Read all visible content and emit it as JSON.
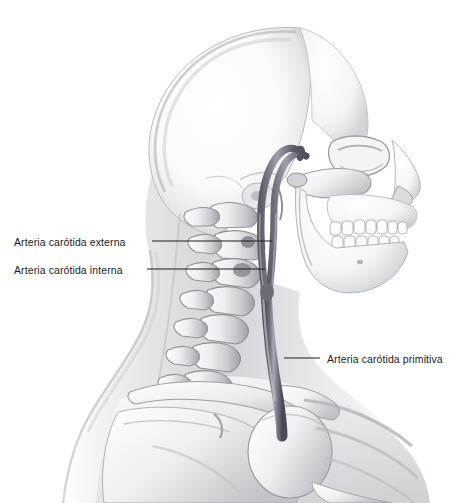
{
  "figure": {
    "kind": "anatomical-illustration",
    "language": "Spanish",
    "background_color": "#ffffff"
  },
  "colors": {
    "background": "#ffffff",
    "bone_light": "#fbfbfc",
    "bone_mid": "#d8dadd",
    "bone_shadow": "#9a9da3",
    "bone_outline": "#6f7378",
    "soft_tissue_light": "#f2f3f4",
    "soft_tissue_mid": "#d5d7da",
    "soft_tissue_dark": "#a8abb0",
    "artery_fill": "#7b7a88",
    "artery_dark": "#4c4b58",
    "artery_highlight": "#b9b8c3",
    "leader_line": "#1c1c1c",
    "label_text": "#1c1c1c"
  },
  "labels": [
    {
      "id": "external",
      "text": "Arteria carótida externa",
      "x": 14,
      "y": 236,
      "leader": {
        "x1": 152,
        "y1": 241,
        "x2": 272,
        "y2": 241
      }
    },
    {
      "id": "internal",
      "text": "Arteria carótida interna",
      "x": 14,
      "y": 264,
      "leader": {
        "x1": 147,
        "y1": 269,
        "x2": 265,
        "y2": 269
      }
    },
    {
      "id": "common",
      "text": "Arteria carótida primitiva",
      "x": 327,
      "y": 353,
      "leader": {
        "x1": 284,
        "y1": 358,
        "x2": 320,
        "y2": 358
      }
    }
  ],
  "structures": [
    {
      "name": "cranium",
      "region": "skull vault"
    },
    {
      "name": "frontal-bone",
      "region": "forehead"
    },
    {
      "name": "orbit",
      "region": "eye socket"
    },
    {
      "name": "nasal-bone",
      "region": "nose"
    },
    {
      "name": "zygomatic-arch",
      "region": "cheek"
    },
    {
      "name": "maxilla-teeth",
      "region": "upper dental arch"
    },
    {
      "name": "mandible-teeth",
      "region": "lower dental arch"
    },
    {
      "name": "mandible-ramus",
      "region": "jaw"
    },
    {
      "name": "cervical-vertebrae",
      "region": "neck spine"
    },
    {
      "name": "clavicle",
      "region": "shoulder"
    },
    {
      "name": "scapula",
      "region": "shoulder blade"
    },
    {
      "name": "humerus-head",
      "region": "upper arm"
    },
    {
      "name": "ribs",
      "region": "thorax"
    },
    {
      "name": "neck-silhouette",
      "region": "soft tissue contour"
    },
    {
      "name": "common-carotid-artery",
      "region": "neck vessel"
    },
    {
      "name": "internal-carotid-artery",
      "region": "neck vessel"
    },
    {
      "name": "external-carotid-artery",
      "region": "neck vessel"
    }
  ]
}
